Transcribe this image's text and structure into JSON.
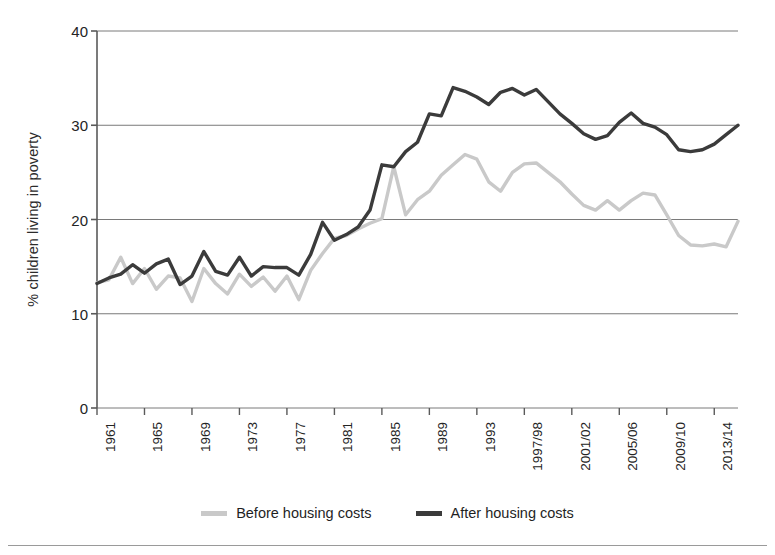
{
  "chart_data": {
    "type": "line",
    "title": "",
    "subtitle": "",
    "xlabel": "",
    "ylabel": "% children living in poverty",
    "ylim": [
      0,
      40
    ],
    "yticks": [
      0,
      10,
      20,
      30,
      40
    ],
    "xlim": [
      1961,
      2015
    ],
    "xtick_labels": [
      "1961",
      "1965",
      "1969",
      "1973",
      "1977",
      "1981",
      "1985",
      "1989",
      "1993",
      "1997/98",
      "2001/02",
      "2005/06",
      "2009/10",
      "2013/14"
    ],
    "xtick_years": [
      1961,
      1965,
      1969,
      1973,
      1977,
      1981,
      1985,
      1989,
      1993,
      1997,
      2001,
      2005,
      2009,
      2013
    ],
    "grid": "horizontal",
    "legend_position": "bottom-center",
    "x": [
      1961,
      1962,
      1963,
      1964,
      1965,
      1966,
      1967,
      1968,
      1969,
      1970,
      1971,
      1972,
      1973,
      1974,
      1975,
      1976,
      1977,
      1978,
      1979,
      1980,
      1981,
      1982,
      1983,
      1984,
      1985,
      1986,
      1987,
      1988,
      1989,
      1990,
      1991,
      1992,
      1993,
      1994,
      1995,
      1996,
      1997,
      1998,
      1999,
      2000,
      2001,
      2002,
      2003,
      2004,
      2005,
      2006,
      2007,
      2008,
      2009,
      2010,
      2011,
      2012,
      2013,
      2014,
      2015
    ],
    "series": [
      {
        "name": "Before housing costs",
        "color": "#c9c9c9",
        "values": [
          13.3,
          13.6,
          16.0,
          13.2,
          14.8,
          12.6,
          14.0,
          13.8,
          11.3,
          14.8,
          13.2,
          12.1,
          14.2,
          12.9,
          13.9,
          12.4,
          14.0,
          11.5,
          14.6,
          16.4,
          18.0,
          18.3,
          19.0,
          19.6,
          20.1,
          25.6,
          20.5,
          22.1,
          23.0,
          24.7,
          25.8,
          26.9,
          26.4,
          24.0,
          23.0,
          25.0,
          25.9,
          26.0,
          25.0,
          24.0,
          22.7,
          21.5,
          21.0,
          22.0,
          21.0,
          22.0,
          22.8,
          22.6,
          20.5,
          18.3,
          17.3,
          17.2,
          17.4,
          17.1,
          19.8
        ]
      },
      {
        "name": "After housing costs",
        "color": "#3b3b3b",
        "values": [
          13.2,
          13.8,
          14.2,
          15.2,
          14.3,
          15.3,
          15.8,
          13.1,
          14.0,
          16.6,
          14.5,
          14.1,
          16.0,
          14.0,
          15.0,
          14.9,
          14.9,
          14.1,
          16.3,
          19.7,
          17.8,
          18.4,
          19.2,
          21.0,
          25.8,
          25.6,
          27.2,
          28.2,
          31.2,
          31.0,
          34.0,
          33.6,
          33.0,
          32.2,
          33.5,
          33.9,
          33.2,
          33.8,
          32.5,
          31.2,
          30.2,
          29.1,
          28.5,
          28.9,
          30.3,
          31.3,
          30.2,
          29.8,
          29.0,
          27.4,
          27.2,
          27.4,
          28.0,
          29.0,
          30.0
        ]
      }
    ]
  },
  "legend": {
    "items": [
      {
        "label": "Before housing costs",
        "color": "#c9c9c9"
      },
      {
        "label": "After housing costs",
        "color": "#3b3b3b"
      }
    ]
  },
  "axes": {
    "axis_color": "#5a5a5a",
    "grid_color": "#7a7a7a",
    "tick_color": "#242424"
  }
}
